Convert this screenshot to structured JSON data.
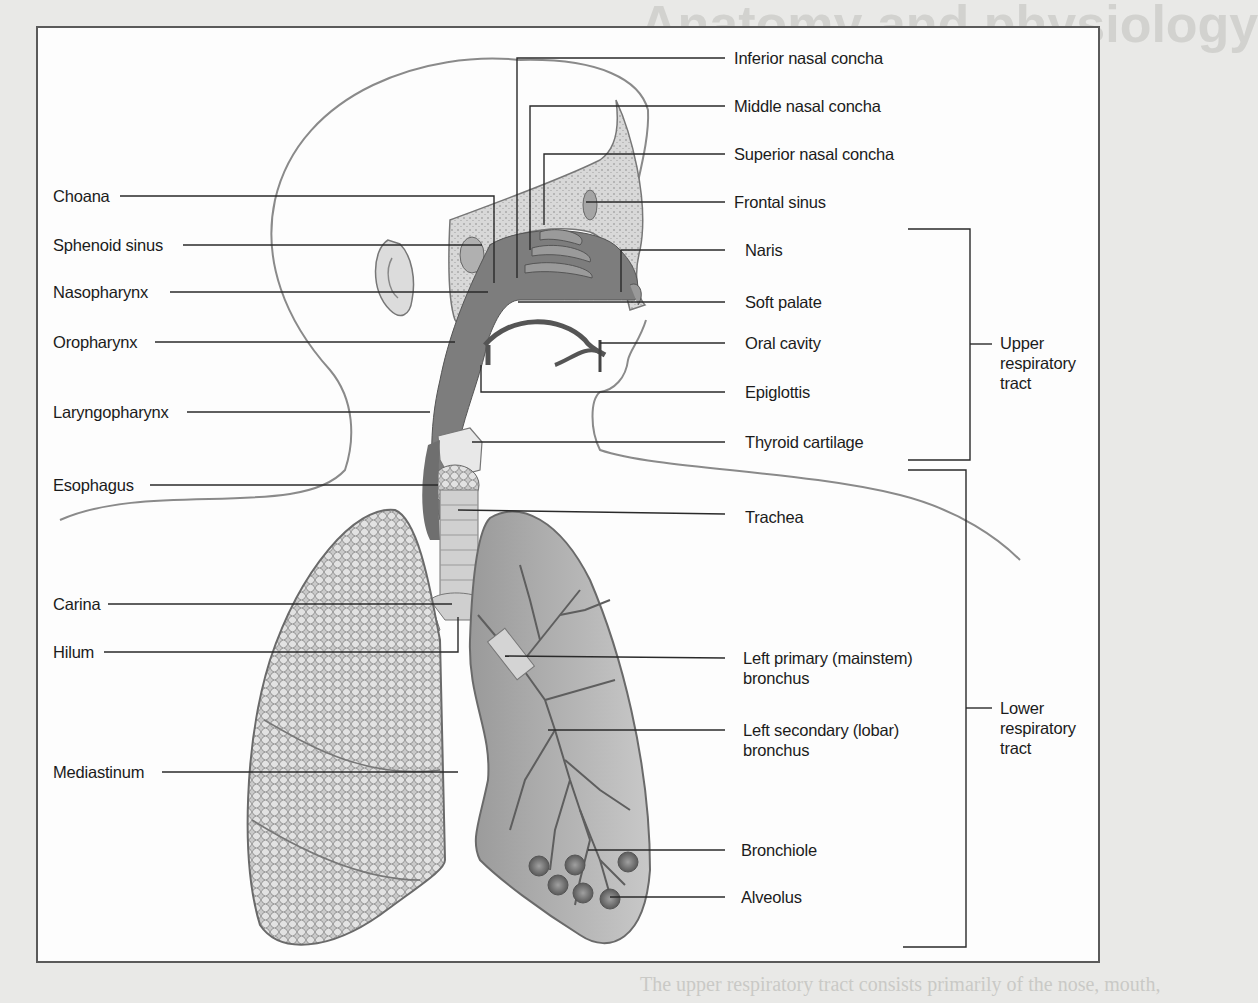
{
  "figure": {
    "topic": "Respiratory system anatomy",
    "background_text": {
      "heading_fragment": "Anatomy and physiology",
      "subheading_fragment": "Just the facts",
      "footer_fragment": "The upper respiratory tract consists primarily of the nose, mouth,"
    },
    "left_labels": [
      {
        "id": "choana",
        "text": "Choana"
      },
      {
        "id": "sphenoid-sinus",
        "text": "Sphenoid sinus"
      },
      {
        "id": "nasopharynx",
        "text": "Nasopharynx"
      },
      {
        "id": "oropharynx",
        "text": "Oropharynx"
      },
      {
        "id": "laryngopharynx",
        "text": "Laryngopharynx"
      },
      {
        "id": "esophagus",
        "text": "Esophagus"
      },
      {
        "id": "carina",
        "text": "Carina"
      },
      {
        "id": "hilum",
        "text": "Hilum"
      },
      {
        "id": "mediastinum",
        "text": "Mediastinum"
      }
    ],
    "right_labels": [
      {
        "id": "inferior-nasal-concha",
        "text": "Inferior nasal concha"
      },
      {
        "id": "middle-nasal-concha",
        "text": "Middle nasal concha"
      },
      {
        "id": "superior-nasal-concha",
        "text": "Superior nasal concha"
      },
      {
        "id": "frontal-sinus",
        "text": "Frontal sinus"
      },
      {
        "id": "naris",
        "text": "Naris"
      },
      {
        "id": "soft-palate",
        "text": "Soft palate"
      },
      {
        "id": "oral-cavity",
        "text": "Oral cavity"
      },
      {
        "id": "epiglottis",
        "text": "Epiglottis"
      },
      {
        "id": "thyroid-cartilage",
        "text": "Thyroid cartilage"
      },
      {
        "id": "trachea",
        "text": "Trachea"
      },
      {
        "id": "left-primary-bronchus",
        "line1": "Left primary (mainstem)",
        "line2": "bronchus"
      },
      {
        "id": "left-secondary-bronchus",
        "line1": "Left secondary (lobar)",
        "line2": "bronchus"
      },
      {
        "id": "bronchiole",
        "text": "Bronchiole"
      },
      {
        "id": "alveolus",
        "text": "Alveolus"
      }
    ],
    "groups": [
      {
        "id": "upper-respiratory-tract",
        "line1": "Upper",
        "line2": "respiratory",
        "line3": "tract"
      },
      {
        "id": "lower-respiratory-tract",
        "line1": "Lower",
        "line2": "respiratory",
        "line3": "tract"
      }
    ],
    "colors": {
      "frame_border": "#5a5a5a",
      "leader_line": "#2a2a2a",
      "airway_fill": "#7d7d7d",
      "lung_fill": "#bdbdbd",
      "page_bg": "#e9e9e7"
    }
  }
}
